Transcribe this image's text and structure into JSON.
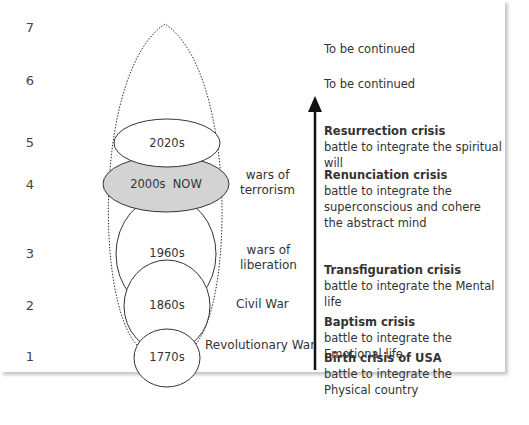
{
  "diagram": {
    "levels": [
      "7",
      "6",
      "5",
      "4",
      "3",
      "2",
      "1"
    ],
    "eras": [
      {
        "label": "2020s",
        "level": 5,
        "fill": "#ffffff"
      },
      {
        "label": "2000s  NOW",
        "level": 4,
        "fill": "#d3d3d3"
      },
      {
        "label": "1960s",
        "level": 3,
        "fill": "#ffffff"
      },
      {
        "label": "1860s",
        "level": 2,
        "fill": "#ffffff"
      },
      {
        "label": "1770s",
        "level": 1,
        "fill": "#ffffff"
      }
    ],
    "side_labels": [
      {
        "lines": [
          "wars of",
          "terrorism"
        ],
        "level": 4
      },
      {
        "lines": [
          "wars of",
          "liberation"
        ],
        "level": 3
      },
      {
        "lines": [
          "Civil War"
        ],
        "level": 2
      },
      {
        "lines": [
          "Revolutionary War"
        ],
        "level": 1
      }
    ],
    "continued": [
      {
        "text": "To be continued",
        "level": 7
      },
      {
        "text": "To be continued",
        "level": 6
      }
    ],
    "crises": [
      {
        "title": "Resurrection crisis",
        "desc": "battle to integrate the spiritual will",
        "level": 5
      },
      {
        "title": "Renunciation crisis",
        "desc": "battle to integrate the superconscious and cohere the abstract mind",
        "level": 4
      },
      {
        "title": "Transfiguration crisis",
        "desc": "battle to integrate the Mental life",
        "level": 3
      },
      {
        "title": "Baptism crisis",
        "desc": "battle to integrate the Emotional life",
        "level": 2
      },
      {
        "title": "Birth crisis of USA",
        "desc": "battle to integrate the Physical country",
        "level": 1
      }
    ],
    "colors": {
      "stroke": "#333333",
      "highlight_fill": "#d3d3d3",
      "arrow": "#111111"
    }
  }
}
